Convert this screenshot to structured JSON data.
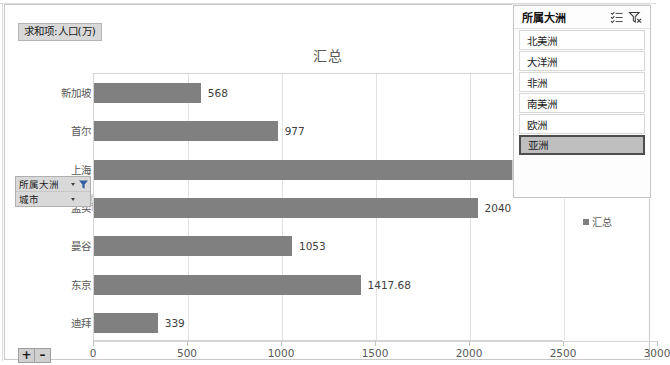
{
  "window": {
    "value_field_button": "求和项:人口(万)"
  },
  "chart": {
    "title": "汇总",
    "legend_label": "汇总",
    "axis_title_y": "城市",
    "series_color": "#808080"
  },
  "field_buttons": [
    {
      "label": "所属大洲",
      "icon": "filter-funnel-icon"
    },
    {
      "label": "城市",
      "icon": "dropdown-caret-icon"
    }
  ],
  "expand_collapse": {
    "expand": "+",
    "collapse": "–"
  },
  "slicer": {
    "title": "所属大洲",
    "multiselect_icon": "multi-select-icon",
    "clear_filter_icon": "clear-filter-icon",
    "items": [
      {
        "label": "北美洲",
        "selected": false
      },
      {
        "label": "大洋洲",
        "selected": false
      },
      {
        "label": "非洲",
        "selected": false
      },
      {
        "label": "南美洲",
        "selected": false
      },
      {
        "label": "欧洲",
        "selected": false
      },
      {
        "label": "亚洲",
        "selected": true
      }
    ]
  },
  "chart_data": {
    "type": "bar",
    "orientation": "horizontal",
    "title": "汇总",
    "xlabel": "",
    "ylabel": "城市",
    "categories": [
      "新加坡",
      "首尔",
      "上海",
      "孟买",
      "曼谷",
      "东京",
      "迪拜"
    ],
    "values": [
      568,
      977,
      2424,
      2040,
      1053,
      1417.68,
      339
    ],
    "data_labels": [
      "568",
      "977",
      "24",
      "2040",
      "1053",
      "1417.68",
      "339"
    ],
    "series": [
      {
        "name": "汇总",
        "values": [
          568,
          977,
          2424,
          2040,
          1053,
          1417.68,
          339
        ]
      }
    ],
    "xlim": [
      0,
      3000
    ],
    "xticks": [
      0,
      500,
      1000,
      1500,
      2000,
      2500,
      3000
    ],
    "xtick_labels": [
      "0",
      "500",
      "1000",
      "1500",
      "2000",
      "2500",
      "3000"
    ],
    "grid": true,
    "legend_position": "right",
    "note": "上海 data label is partially occluded by the slicer panel; only \"24\" is visible."
  }
}
